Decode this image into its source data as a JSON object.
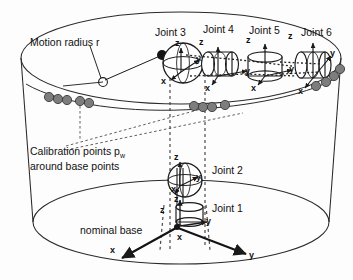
{
  "figure": {
    "type": "technical-diagram",
    "background_color": "#fdfdfd",
    "line_color": "#1a1a1a",
    "calibration_dot_color": "#7d7d7d",
    "calibration_dot_stroke": "#3a3a3a"
  },
  "annotations": {
    "motion_radius": "Motion radius r",
    "calibration_points_line1": "Calibration points p",
    "calibration_points_sub": "w",
    "calibration_points_line2": "around base points",
    "nominal_base": "nominal base"
  },
  "joints": [
    {
      "id": "joint1",
      "label": "Joint 1",
      "shape": "cylinder"
    },
    {
      "id": "joint2",
      "label": "Joint 2",
      "shape": "sphere"
    },
    {
      "id": "joint3",
      "label": "Joint 3",
      "shape": "sphere"
    },
    {
      "id": "joint4",
      "label": "Joint 4",
      "shape": "cylinder"
    },
    {
      "id": "joint5",
      "label": "Joint 5",
      "shape": "cylinder"
    },
    {
      "id": "joint6",
      "label": "Joint 6",
      "shape": "cylinder"
    }
  ],
  "frames": {
    "base": {
      "x": "x",
      "y": "y",
      "z": "z"
    },
    "joint1": {
      "x": "x",
      "y": "y",
      "z": "z"
    },
    "joint2": {
      "x": "x",
      "y": "y",
      "z": "z"
    },
    "joint3": {
      "x": "x",
      "y": "y",
      "z": "z"
    },
    "joint4": {
      "x": "x",
      "y": "y",
      "z": "z"
    },
    "joint5": {
      "x": "x",
      "y": "y",
      "z": "z"
    },
    "joint6": {
      "x": "x",
      "y": "y",
      "z": "z"
    }
  },
  "calibration_clusters": [
    {
      "id": "cluster-left",
      "count": 5
    },
    {
      "id": "cluster-mid",
      "count": 4
    },
    {
      "id": "cluster-right",
      "count": 4
    }
  ]
}
